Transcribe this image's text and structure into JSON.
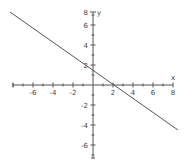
{
  "chart_data": {
    "type": "line",
    "title": "",
    "xlabel": "x",
    "ylabel": "y",
    "xlim": [
      -8,
      8
    ],
    "ylim": [
      -7,
      7
    ],
    "grid": false,
    "x_ticks": [
      -6,
      -4,
      -2,
      2,
      4,
      6,
      8
    ],
    "x_tick_labels": [
      "-6",
      "-4",
      "-2",
      "2",
      "4",
      "6",
      "8"
    ],
    "y_ticks": [
      8,
      6,
      4,
      2,
      -2,
      -4,
      -6
    ],
    "y_tick_labels": [
      "8",
      "6",
      "4",
      "2",
      "-2",
      "-4",
      "-6"
    ],
    "series": [
      {
        "name": "line",
        "x": [
          -8.3,
          8.5
        ],
        "y": [
          7.3,
          -4.5
        ],
        "color": "#555555"
      }
    ]
  }
}
